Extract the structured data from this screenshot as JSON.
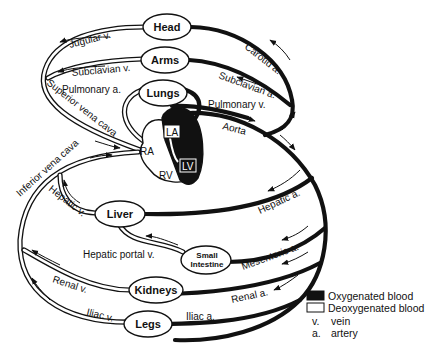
{
  "diagram": {
    "organs": {
      "head": "Head",
      "arms": "Arms",
      "lungs": "Lungs",
      "liver": "Liver",
      "small_intestine_line1": "Small",
      "small_intestine_line2": "Intestine",
      "kidneys": "Kidneys",
      "legs": "Legs"
    },
    "heart": {
      "la": "LA",
      "lv": "LV",
      "ra": "RA",
      "rv": "RV"
    },
    "veins": {
      "jugular": "Jugular v.",
      "subclavian": "Subclavian v.",
      "pulmonary_artery": "Pulmonary a.",
      "superior_vena_cava": "Superior vena cava",
      "inferior_vena_cava": "Inferior vena cava",
      "hepatic": "Hepatic v.",
      "hepatic_portal": "Hepatic portal v.",
      "renal": "Renal v.",
      "iliac": "Iliac v."
    },
    "arteries": {
      "carotid": "Carotid a.",
      "subclavian": "Subclavian a.",
      "pulmonary_vein": "Pulmonary v.",
      "aorta": "Aorta",
      "hepatic": "Hepatic a.",
      "mesenteric": "Mesenteric a.",
      "renal": "Renal a.",
      "iliac": "Iliac a."
    }
  },
  "legend": {
    "oxygenated": "Oxygenated blood",
    "deoxygenated": "Deoxygenated blood",
    "vein_abbr": "v.",
    "vein_text": "vein",
    "artery_abbr": "a.",
    "artery_text": "artery",
    "oxygenated_color": "#111111",
    "deoxygenated_color": "#ffffff"
  }
}
